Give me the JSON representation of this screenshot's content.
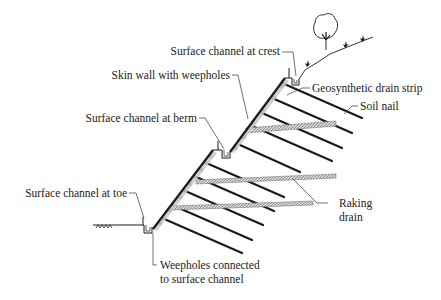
{
  "diagram": {
    "type": "soil-nailed slope cross-section with drainage provisions",
    "colors": {
      "line": "#1a1a1a",
      "leader": "#333333",
      "shading": "#c8c8c8",
      "drain": "#8a8a8a",
      "text": "#222222"
    },
    "labels": {
      "crest_channel": "Surface channel at crest",
      "skin_wall": "Skin wall with weepholes",
      "berm_channel": "Surface channel at berm",
      "toe_channel": "Surface channel at toe",
      "drain_strip": "Geosynthetic drain strip",
      "soil_nail": "Soil nail",
      "raking_drain_line1": "Raking",
      "raking_drain_line2": "drain",
      "weepholes_line1": "Weepholes connected",
      "weepholes_line2": "to surface channel"
    },
    "components": [
      "slope-face",
      "berm",
      "crest",
      "toe",
      "soil-nails",
      "raking-drains",
      "surface-channels",
      "geosynthetic-drain-strip",
      "vegetation"
    ]
  }
}
